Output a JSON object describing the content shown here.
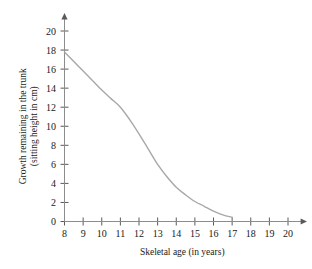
{
  "chart_data": {
    "type": "line",
    "title": "",
    "xlabel": "Skeletal age (in years)",
    "ylabel": "Growth remaining in the trunk (sitting height in cm)",
    "ylabel_line1": "Growth remaining in the trunk",
    "ylabel_line2": "(sitting height in cm)",
    "xlim": [
      8,
      20
    ],
    "ylim": [
      0,
      20
    ],
    "xticks": [
      8,
      9,
      10,
      11,
      12,
      13,
      14,
      15,
      16,
      17,
      18,
      19,
      20
    ],
    "yticks": [
      0,
      2,
      4,
      6,
      8,
      10,
      12,
      14,
      16,
      18,
      20
    ],
    "xtick_labels": [
      "8",
      "9",
      "10",
      "11",
      "12",
      "13",
      "14",
      "15",
      "16",
      "17",
      "18",
      "19",
      "20"
    ],
    "ytick_labels": [
      "0",
      "2",
      "4",
      "6",
      "8",
      "10",
      "12",
      "14",
      "16",
      "18",
      "20"
    ],
    "grid": false,
    "legend": false,
    "legend_position": "none",
    "curve_color": "#a8a8a8",
    "curve_width": 1.4,
    "axis_color": "#8c8c8c",
    "series": [
      {
        "name": "Growth remaining in the trunk",
        "x": [
          8.0,
          8.5,
          9.0,
          9.5,
          10.0,
          10.5,
          11.0,
          11.5,
          12.0,
          12.5,
          13.0,
          13.5,
          14.0,
          14.5,
          15.0,
          15.5,
          16.0,
          16.5,
          17.0
        ],
        "values": [
          17.8,
          16.8,
          15.8,
          14.8,
          13.8,
          12.9,
          12.0,
          10.7,
          9.2,
          7.6,
          6.0,
          4.7,
          3.6,
          2.8,
          2.1,
          1.6,
          1.1,
          0.7,
          0.45
        ]
      }
    ],
    "annotations": []
  },
  "figure": {
    "background_color": "#ffffff",
    "x_axis_has_arrow": true,
    "y_axis_has_arrow": true
  }
}
